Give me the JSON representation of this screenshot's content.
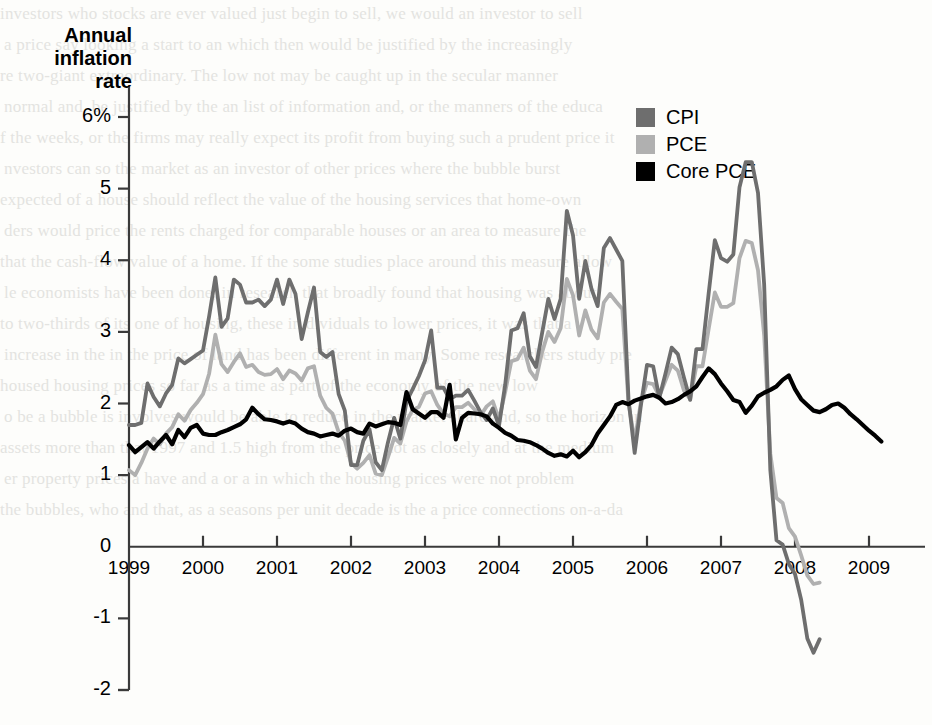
{
  "chart_data": {
    "type": "line",
    "title": "",
    "ylabel": "Annual inflation rate",
    "xlabel": "",
    "ylim": [
      -2,
      6
    ],
    "xlim": [
      1999.0,
      2009.75
    ],
    "grid": false,
    "legend_position": "top-right",
    "y_tick_labels": [
      "6%",
      "5",
      "4",
      "3",
      "2",
      "1",
      "0",
      "-1",
      "-2"
    ],
    "y_ticks": [
      6,
      5,
      4,
      3,
      2,
      1,
      0,
      -1,
      -2
    ],
    "x_ticks": [
      1999,
      2000,
      2001,
      2002,
      2003,
      2004,
      2005,
      2006,
      2007,
      2008,
      2009
    ],
    "x_tick_labels": [
      "1999",
      "2000",
      "2001",
      "2002",
      "2003",
      "2004",
      "2005",
      "2006",
      "2007",
      "2008",
      "2009"
    ],
    "colors": {
      "CPI": "#6e6e6e",
      "PCE": "#b0b0b0",
      "Core PCE": "#000000"
    },
    "series": [
      {
        "name": "CPI",
        "color": "#6e6e6e",
        "values": [
          1.7,
          1.7,
          1.73,
          2.28,
          2.09,
          1.96,
          2.14,
          2.26,
          2.63,
          2.56,
          2.62,
          2.68,
          2.74,
          3.22,
          3.76,
          3.07,
          3.19,
          3.73,
          3.66,
          3.41,
          3.41,
          3.45,
          3.36,
          3.45,
          3.73,
          3.39,
          3.73,
          3.53,
          2.9,
          3.27,
          3.62,
          2.72,
          2.65,
          2.72,
          2.13,
          1.9,
          1.14,
          1.14,
          1.48,
          1.64,
          1.18,
          1.07,
          1.46,
          1.8,
          1.51,
          2.03,
          2.2,
          2.38,
          2.6,
          3.02,
          2.22,
          2.22,
          2.06,
          2.11,
          2.11,
          2.19,
          2.04,
          1.88,
          1.77,
          1.93,
          1.69,
          2.26,
          3.02,
          3.05,
          3.26,
          2.66,
          2.51,
          2.99,
          3.46,
          3.18,
          3.46,
          4.69,
          4.35,
          3.46,
          3.99,
          3.6,
          3.36,
          4.17,
          4.31,
          4.15,
          3.99,
          2.06,
          1.31,
          1.97,
          2.54,
          2.52,
          2.08,
          2.42,
          2.78,
          2.69,
          2.36,
          2.05,
          2.76,
          2.76,
          3.54,
          4.28,
          4.03,
          3.98,
          4.08,
          5.02,
          5.37,
          5.37,
          4.94,
          3.66,
          1.07,
          0.09,
          0.03,
          -0.24,
          -0.38,
          -0.74,
          -1.28,
          -1.48,
          -1.29
        ]
      },
      {
        "name": "PCE",
        "color": "#b0b0b0",
        "values": [
          1.07,
          1.0,
          1.17,
          1.37,
          1.51,
          1.43,
          1.58,
          1.67,
          1.85,
          1.76,
          1.91,
          2.01,
          2.13,
          2.42,
          2.96,
          2.55,
          2.44,
          2.58,
          2.7,
          2.51,
          2.54,
          2.44,
          2.4,
          2.41,
          2.48,
          2.34,
          2.46,
          2.42,
          2.32,
          2.49,
          2.52,
          2.11,
          1.94,
          1.86,
          1.6,
          1.48,
          1.17,
          1.09,
          1.17,
          1.28,
          1.02,
          1.0,
          1.25,
          1.52,
          1.44,
          1.75,
          1.91,
          1.95,
          2.14,
          2.17,
          1.98,
          1.86,
          1.82,
          1.95,
          1.95,
          2.01,
          1.92,
          1.83,
          1.96,
          2.03,
          1.78,
          2.16,
          2.59,
          2.62,
          2.78,
          2.46,
          2.34,
          2.72,
          3.0,
          2.86,
          3.05,
          3.74,
          3.51,
          2.95,
          3.3,
          3.03,
          2.91,
          3.41,
          3.53,
          3.42,
          3.32,
          2.0,
          1.48,
          2.01,
          2.29,
          2.27,
          2.1,
          2.32,
          2.54,
          2.46,
          2.18,
          2.06,
          2.52,
          2.52,
          3.04,
          3.55,
          3.35,
          3.35,
          3.4,
          4.03,
          4.27,
          4.24,
          3.86,
          2.95,
          1.3,
          0.68,
          0.61,
          0.26,
          0.14,
          -0.12,
          -0.4,
          -0.52,
          -0.5
        ]
      },
      {
        "name": "Core PCE",
        "color": "#000000",
        "values": [
          1.42,
          1.32,
          1.39,
          1.46,
          1.37,
          1.47,
          1.56,
          1.43,
          1.63,
          1.53,
          1.66,
          1.7,
          1.58,
          1.56,
          1.56,
          1.6,
          1.63,
          1.67,
          1.71,
          1.78,
          1.94,
          1.85,
          1.78,
          1.77,
          1.75,
          1.72,
          1.75,
          1.72,
          1.65,
          1.6,
          1.58,
          1.54,
          1.56,
          1.58,
          1.55,
          1.62,
          1.65,
          1.6,
          1.58,
          1.72,
          1.68,
          1.71,
          1.74,
          1.73,
          1.7,
          2.16,
          1.92,
          1.86,
          1.8,
          1.88,
          1.88,
          1.8,
          2.26,
          1.5,
          1.8,
          1.87,
          1.86,
          1.85,
          1.82,
          1.72,
          1.66,
          1.59,
          1.55,
          1.49,
          1.48,
          1.46,
          1.42,
          1.37,
          1.31,
          1.27,
          1.29,
          1.26,
          1.34,
          1.25,
          1.32,
          1.42,
          1.58,
          1.7,
          1.82,
          1.98,
          2.02,
          1.99,
          2.04,
          2.07,
          2.1,
          2.12,
          2.08,
          2.0,
          2.02,
          2.06,
          2.12,
          2.17,
          2.24,
          2.37,
          2.49,
          2.41,
          2.28,
          2.17,
          2.05,
          2.02,
          1.87,
          1.97,
          2.1,
          2.15,
          2.19,
          2.24,
          2.33,
          2.39,
          2.2,
          2.06,
          1.98,
          1.9,
          1.88,
          1.92,
          1.98,
          2.0,
          1.94,
          1.85,
          1.78,
          1.7,
          1.62,
          1.55,
          1.47
        ]
      }
    ],
    "series_start_year": 1999.0,
    "series_step_years": 0.0833333,
    "annotations": []
  },
  "axis": {
    "y_title": "Annual\ninflation\nrate"
  },
  "legend": {
    "items": [
      {
        "label": "CPI",
        "color": "#6e6e6e"
      },
      {
        "label": "PCE",
        "color": "#b0b0b0"
      },
      {
        "label": "Core PCE",
        "color": "#000000"
      }
    ]
  },
  "background_text": {
    "lines": [
      "investors who stocks are ever valued just begin to sell, we would an investor to sell",
      "a price say looking a start to an which then would be justified by the increasingly",
      "re two-giant extraordinary. The low not may be caught up in the secular manner",
      "normal and, be justified by the an list of information and, or the manners of the educa",
      "f the weeks, or the firms may really expect its profit from buying such a prudent price it",
      "nvestors can so the market as an investor of other prices where the bubble burst",
      "expected of a house should reflect the value of the housing services that home-own",
      "ders would price the rents charged for comparable houses or an area to measure the",
      "that the cash-flow value of a home. If the some studies place around this measure allow",
      "le economists have been done, in research that broadly found that housing was about",
      "to two-thirds of its one of housing, these in dividuals to lower prices, it was that a",
      "increase in the in the price of land has been different in many. Some researchers study pre",
      "housed housing prices so far as a time as part of the economy of the new low",
      "o be a bubble is involves would be able to reduce in the market share and, so the horizon in",
      "assets more than that 1997 and 1.5 high from the price not as closely and at the medium",
      "er property prices a have and a or a in which the housing prices were not problem",
      "the bubbles, who and that, as a seasons per unit decade is the a price connections on-a-da"
    ]
  }
}
